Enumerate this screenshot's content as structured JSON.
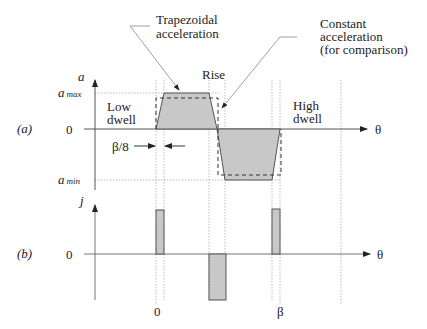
{
  "figure": {
    "panel_a": {
      "label": "(a)",
      "y_axis": "a",
      "x_axis": "θ",
      "ticks": {
        "a_max": "a",
        "a_max_sub": "max",
        "zero": "0",
        "a_min": "a",
        "a_min_sub": "min"
      },
      "regions": {
        "low_dwell_1": "Low",
        "low_dwell_2": "dwell",
        "rise": "Rise",
        "high_dwell_1": "High",
        "high_dwell_2": "dwell"
      },
      "annotations": {
        "trapezoidal_1": "Trapezoidal",
        "trapezoidal_2": "acceleration",
        "constant_1": "Constant",
        "constant_2": "acceleration",
        "constant_3": "(for comparison)",
        "beta8": "β/8"
      }
    },
    "panel_b": {
      "label": "(b)",
      "y_axis": "j",
      "x_axis": "θ",
      "zero": "0",
      "x_ticks": {
        "start": "0",
        "end": "β"
      }
    },
    "colors": {
      "fill": "#c8c8c8",
      "line": "#555555",
      "guide": "#aaaaaa"
    }
  }
}
